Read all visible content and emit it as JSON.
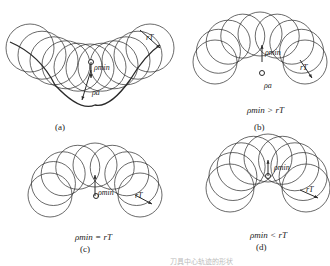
{
  "figure": {
    "panels": [
      {
        "id": "a",
        "label": "(a)",
        "relation": "",
        "symbols": {
          "rho_min": "ρmin",
          "rho_a": "ρa",
          "r_T": "rT"
        },
        "shape": "concave-valley"
      },
      {
        "id": "b",
        "label": "(b)",
        "relation": "ρmin > rT",
        "symbols": {
          "rho_min": "ρmin",
          "rho_a": "ρa",
          "r_T": "rT"
        },
        "shape": "arch-with-gouge-loop"
      },
      {
        "id": "c",
        "label": "(c)",
        "relation": "ρmin = rT",
        "symbols": {
          "rho_min": "ρmin",
          "r_T": "rT"
        },
        "shape": "arch-cusp"
      },
      {
        "id": "d",
        "label": "(d)",
        "relation": "ρmin < rT",
        "symbols": {
          "rho_min": "ρmin",
          "r_T": "rT"
        },
        "shape": "arch-overlap"
      }
    ],
    "caption_fragment": "刀具中心轨迹的形状"
  },
  "colors": {
    "line": "#2a2a2a",
    "background": "#ffffff",
    "caption": "#bbbbbb"
  }
}
